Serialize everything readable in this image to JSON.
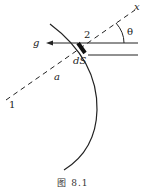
{
  "diagram": {
    "labels": {
      "x_axis": "x",
      "angle": "θ",
      "region_2": "2",
      "gravity": "g",
      "surface_element": "dS",
      "direction_a": "a",
      "region_1": "1"
    },
    "caption": "图 8.1",
    "colors": {
      "line": "#222222",
      "background": "#ffffff"
    }
  }
}
